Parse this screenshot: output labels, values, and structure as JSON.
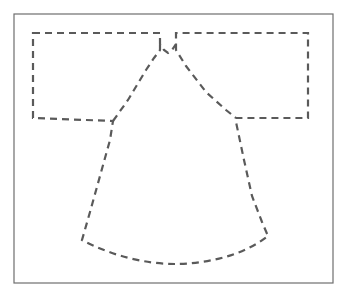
{
  "figure": {
    "width": 348,
    "height": 295,
    "background_color": "#ffffff"
  },
  "frame": {
    "name": "image-border",
    "x": 14,
    "y": 14,
    "width": 319,
    "height": 269,
    "stroke_color": "#6e6e6e",
    "stroke_width": 1.2,
    "fill_color": "#ffffff"
  },
  "garment": {
    "name": "kimono-outline",
    "style": "dashed",
    "stroke_color": "#5a5a5a",
    "stroke_width": 2.2,
    "dash_pattern": "7 5",
    "description": "T-shaped kimono/robe outline with rectangular sleeves, notched neckline, sloping shoulders, flared body and curved hem",
    "path": "M 33 33 L 160 33 L 160 44 L 164 50 L 168 53 L 172 50 L 176 44 L 176 33 L 308 33 L 308 118 L 236 118 L 236 122 L 244 160 L 252 196 L 262 222 L 268 236 C 240 258 200 264 175 264 C 146 264 112 256 82 240 L 90 212 L 100 176 L 110 140 L 113 121 L 33 118 Z",
    "segments": [
      {
        "name": "left-sleeve-top-edge",
        "from": [
          33,
          33
        ],
        "to": [
          160,
          33
        ]
      },
      {
        "name": "neckline-notch",
        "from": [
          160,
          33
        ],
        "to": [
          176,
          33
        ]
      },
      {
        "name": "right-sleeve-top-edge",
        "from": [
          176,
          33
        ],
        "to": [
          308,
          33
        ]
      },
      {
        "name": "right-sleeve-outer-edge",
        "from": [
          308,
          33
        ],
        "to": [
          308,
          118
        ]
      },
      {
        "name": "right-sleeve-bottom-edge",
        "from": [
          308,
          118
        ],
        "to": [
          236,
          118
        ]
      },
      {
        "name": "right-body-side",
        "from": [
          236,
          122
        ],
        "to": [
          268,
          236
        ]
      },
      {
        "name": "bottom-hem-curve",
        "from": [
          268,
          236
        ],
        "to": [
          82,
          240
        ]
      },
      {
        "name": "left-body-side",
        "from": [
          82,
          240
        ],
        "to": [
          113,
          121
        ]
      },
      {
        "name": "left-sleeve-bottom-edge",
        "from": [
          113,
          121
        ],
        "to": [
          33,
          118
        ]
      },
      {
        "name": "left-sleeve-outer-edge",
        "from": [
          33,
          118
        ],
        "to": [
          33,
          33
        ]
      },
      {
        "name": "left-shoulder-slope",
        "from": [
          113,
          121
        ],
        "to": [
          160,
          44
        ]
      },
      {
        "name": "right-shoulder-slope",
        "from": [
          176,
          44
        ],
        "to": [
          236,
          118
        ]
      }
    ]
  },
  "shoulders": {
    "left_shoulder_path": "M 113 121 L 128 100 L 146 70 L 154 58 L 160 50 L 160 44",
    "right_shoulder_path": "M 176 44 L 176 50 L 186 66 L 206 92 L 226 110 L 236 118"
  }
}
